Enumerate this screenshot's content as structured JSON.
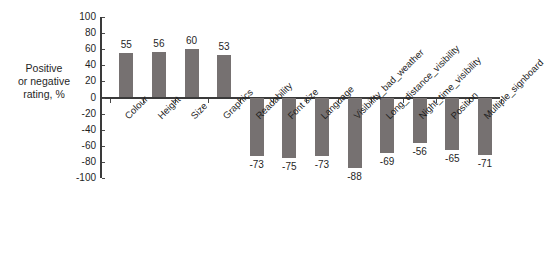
{
  "chart_data": {
    "type": "bar",
    "title": "",
    "xlabel": "",
    "ylabel": "Positive\nor negative\nrating, %",
    "ylim": [
      -100,
      100
    ],
    "ytick_labels": [
      "100",
      "80",
      "60",
      "40",
      "20",
      "0",
      "-20",
      "-40",
      "-60",
      "-80",
      "-100"
    ],
    "ytick_values": [
      100,
      80,
      60,
      40,
      20,
      0,
      -20,
      -40,
      -60,
      -80,
      -100
    ],
    "grid": false,
    "legend": false,
    "bar_color": "#767171",
    "axis_color": "#3a3a3a",
    "categories": [
      "Colour",
      "Height",
      "Size",
      "Graphics",
      "Readability",
      "Font size",
      "Language",
      "Visibility_bad_weather",
      "Long_distance_visibility",
      "Night_time_visibility",
      "Position",
      "Multiple_signboard"
    ],
    "values": [
      55,
      56,
      60,
      53,
      -73,
      -75,
      -73,
      -88,
      -69,
      -56,
      -65,
      -71
    ],
    "data_labels": [
      "55",
      "56",
      "60",
      "53",
      "-73",
      "-75",
      "-73",
      "-88",
      "-69",
      "-56",
      "-65",
      "-71"
    ]
  }
}
